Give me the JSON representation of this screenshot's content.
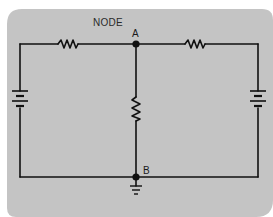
{
  "diagram": {
    "title_label": "NODE",
    "nodes": [
      {
        "label": "A",
        "position": "top-center junction"
      },
      {
        "label": "B",
        "position": "bottom-center junction"
      }
    ],
    "components": [
      {
        "type": "resistor",
        "location": "top-left branch"
      },
      {
        "type": "resistor",
        "location": "top-right branch"
      },
      {
        "type": "resistor",
        "location": "center vertical branch A-B"
      },
      {
        "type": "battery",
        "location": "left vertical branch"
      },
      {
        "type": "battery",
        "location": "right vertical branch"
      },
      {
        "type": "ground",
        "location": "below node B"
      }
    ],
    "colors": {
      "panel": "#c4c4c4",
      "wire": "#111111"
    }
  }
}
